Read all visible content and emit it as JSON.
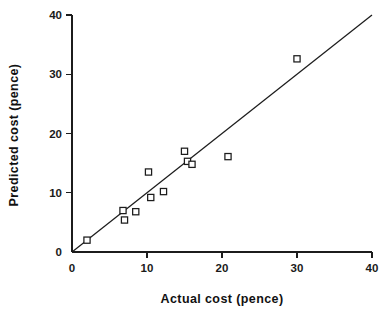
{
  "chart_data": {
    "type": "scatter",
    "title": "",
    "xlabel": "Actual cost (pence)",
    "ylabel": "Predicted cost (pence)",
    "xlim": [
      0,
      40
    ],
    "ylim": [
      0,
      40
    ],
    "xticks": [
      0,
      10,
      20,
      30,
      40
    ],
    "yticks": [
      0,
      10,
      20,
      30,
      40
    ],
    "xtick_labels": [
      "0",
      "10",
      "20",
      "30",
      "40"
    ],
    "ytick_labels": [
      "0",
      "10",
      "20",
      "30",
      "40"
    ],
    "grid": false,
    "legend": null,
    "marker_style": "open-square",
    "marker_color": "#ffffff",
    "marker_edge_color": "#1c1c1c",
    "line_color": "#1c1c1c",
    "background_color": "#ffffff",
    "points": [
      {
        "x": 2.0,
        "y": 2.0
      },
      {
        "x": 6.8,
        "y": 7.0
      },
      {
        "x": 7.0,
        "y": 5.4
      },
      {
        "x": 8.5,
        "y": 6.8
      },
      {
        "x": 10.2,
        "y": 13.5
      },
      {
        "x": 10.5,
        "y": 9.2
      },
      {
        "x": 12.2,
        "y": 10.2
      },
      {
        "x": 15.0,
        "y": 17.0
      },
      {
        "x": 15.4,
        "y": 15.3
      },
      {
        "x": 16.0,
        "y": 14.8
      },
      {
        "x": 20.8,
        "y": 16.1
      },
      {
        "x": 30.0,
        "y": 32.6
      }
    ],
    "reference_line": {
      "name": "identity-line",
      "x": [
        0,
        40
      ],
      "y": [
        0,
        40
      ]
    }
  }
}
